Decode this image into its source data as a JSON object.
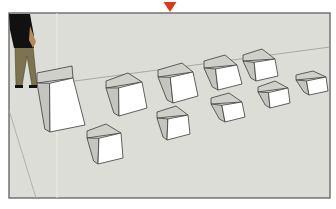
{
  "app": {
    "type": "3D modeling viewport"
  },
  "viewport": {
    "background_color": "#dcddd6",
    "frame": {
      "x": 9,
      "y": 13,
      "width": 321,
      "height": 185
    },
    "marker": {
      "name": "axis-origin-marker",
      "color": "#d83a1c",
      "cx": 170,
      "top": 2,
      "width": 13,
      "height": 11
    }
  },
  "cubes": [
    {
      "name": "tall-cube",
      "pts": {
        "tl": [
          37,
          73
        ],
        "tr": [
          72,
          66
        ],
        "fr": [
          85,
          125
        ],
        "fl": [
          50,
          132
        ],
        "ftl": [
          37,
          83
        ],
        "ftr": [
          73,
          78
        ]
      }
    },
    {
      "name": "cube-row1-2",
      "pts": {
        "tl": [
          106,
          81
        ],
        "tr": [
          128,
          73
        ],
        "fr": [
          147,
          108
        ],
        "fl": [
          119,
          116
        ],
        "ftl": [
          106,
          88
        ],
        "ftr": [
          142,
          82
        ]
      }
    },
    {
      "name": "cube-row1-3",
      "pts": {
        "tl": [
          158,
          70
        ],
        "tr": [
          182,
          63
        ],
        "fr": [
          198,
          96
        ],
        "fl": [
          173,
          103
        ],
        "ftl": [
          158,
          77
        ],
        "ftr": [
          193,
          72
        ]
      }
    },
    {
      "name": "cube-row1-4",
      "pts": {
        "tl": [
          204,
          61
        ],
        "tr": [
          225,
          55
        ],
        "fr": [
          242,
          84
        ],
        "fl": [
          218,
          90
        ],
        "ftl": [
          204,
          68
        ],
        "ftr": [
          237,
          65
        ]
      }
    },
    {
      "name": "cube-row1-5",
      "pts": {
        "tl": [
          243,
          55
        ],
        "tr": [
          262,
          49
        ],
        "fr": [
          278,
          76
        ],
        "fl": [
          256,
          81
        ],
        "ftl": [
          243,
          61
        ],
        "ftr": [
          275,
          59
        ]
      }
    },
    {
      "name": "cube-row1-6",
      "pts": {
        "tl": [
          296,
          75
        ],
        "tr": [
          313,
          71
        ],
        "fr": [
          328,
          91
        ],
        "fl": [
          309,
          95
        ],
        "ftl": [
          296,
          80
        ],
        "ftr": [
          326,
          77
        ]
      }
    },
    {
      "name": "cube-row2-1",
      "pts": {
        "tl": [
          87,
          131
        ],
        "tr": [
          106,
          124
        ],
        "fr": [
          123,
          158
        ],
        "fl": [
          98,
          164
        ],
        "ftl": [
          87,
          138
        ],
        "ftr": [
          121,
          133
        ]
      }
    },
    {
      "name": "cube-row2-2",
      "pts": {
        "tl": [
          157,
          112
        ],
        "tr": [
          176,
          106
        ],
        "fr": [
          190,
          134
        ],
        "fl": [
          167,
          140
        ],
        "ftl": [
          157,
          118
        ],
        "ftr": [
          188,
          115
        ]
      }
    },
    {
      "name": "cube-row2-3",
      "pts": {
        "tl": [
          211,
          98
        ],
        "tr": [
          229,
          93
        ],
        "fr": [
          245,
          117
        ],
        "fl": [
          225,
          122
        ],
        "ftl": [
          211,
          104
        ],
        "ftr": [
          242,
          102
        ]
      }
    },
    {
      "name": "cube-row2-4",
      "pts": {
        "tl": [
          258,
          87
        ],
        "tr": [
          275,
          81
        ],
        "fr": [
          290,
          103
        ],
        "fl": [
          270,
          108
        ],
        "ftl": [
          258,
          92
        ],
        "ftr": [
          288,
          88
        ]
      }
    }
  ],
  "figure": {
    "name": "scale-figure",
    "shirt_color": "#111111",
    "pants_color": "#7d7350",
    "skin_color": "#b58a5c"
  }
}
